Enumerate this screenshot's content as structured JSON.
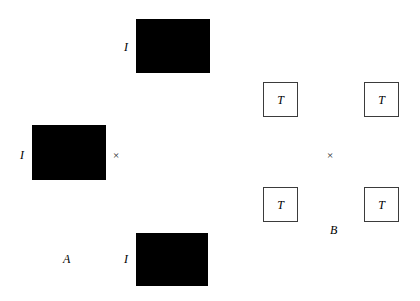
{
  "figure": {
    "background_color": "#ffffff",
    "block_fill_color": "#000000",
    "square_stroke_color": "#3b3b3b",
    "square_fill_color": "#ffffff",
    "width": 420,
    "height": 301
  },
  "group_a": {
    "caption": "A",
    "center_marker": "×",
    "blocks": [
      {
        "label": "I",
        "x": 136,
        "y": 19,
        "w": 74,
        "h": 54,
        "label_x": 124,
        "label_y": 41
      },
      {
        "label": "I",
        "x": 32,
        "y": 125,
        "w": 74,
        "h": 55,
        "label_x": 20,
        "label_y": 149
      },
      {
        "label": "I",
        "x": 136,
        "y": 233,
        "w": 72,
        "h": 53,
        "label_x": 124,
        "label_y": 253
      }
    ],
    "marker_x": 113,
    "marker_y": 150,
    "caption_x": 63,
    "caption_y": 253
  },
  "group_b": {
    "caption": "B",
    "center_marker": "×",
    "squares": [
      {
        "label": "T",
        "x": 263,
        "y": 82,
        "size": 35
      },
      {
        "label": "T",
        "x": 364,
        "y": 82,
        "size": 35
      },
      {
        "label": "T",
        "x": 263,
        "y": 187,
        "size": 35
      },
      {
        "label": "T",
        "x": 364,
        "y": 187,
        "size": 35
      }
    ],
    "marker_x": 327,
    "marker_y": 150,
    "caption_x": 330,
    "caption_y": 224
  }
}
